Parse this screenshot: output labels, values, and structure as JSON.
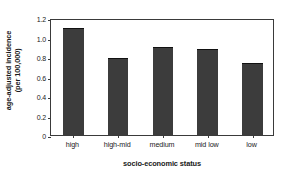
{
  "chart_data": {
    "type": "bar",
    "title": "",
    "categories": [
      "high",
      "high-mid",
      "medium",
      "mid low",
      "low"
    ],
    "values": [
      1.1,
      0.79,
      0.9,
      0.88,
      0.74
    ],
    "xlabel": "socio-economic status",
    "ylabel_line1": "age-adjusted incidence",
    "ylabel_line2": "(per 100,000)",
    "ytick_labels": [
      "0",
      "0.2",
      "0.4",
      "0.6",
      "0.8",
      "1.0",
      "1.2"
    ],
    "ytick_values": [
      0,
      0.2,
      0.4,
      0.6,
      0.8,
      1.0,
      1.2
    ],
    "ylim": [
      0,
      1.2
    ],
    "grid": false,
    "legend": "none",
    "bar_color": "#3c3c3c",
    "axis_color": "#3a3a3a",
    "background_color": "#ffffff"
  }
}
